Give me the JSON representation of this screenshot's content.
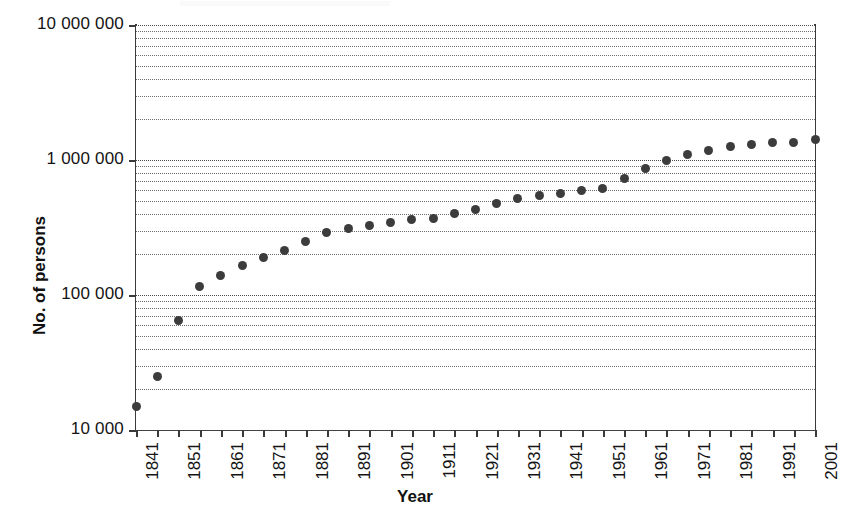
{
  "chart_data": {
    "type": "scatter",
    "title": "",
    "xlabel": "Year",
    "ylabel": "No. of persons",
    "yscale": "log",
    "ylim": [
      10000,
      10000000
    ],
    "xlim": [
      1841,
      2001
    ],
    "grid": true,
    "legend": false,
    "y_tick_labels": [
      "10 000 000",
      "1 000 000",
      "100 000",
      "10 000"
    ],
    "y_tick_values": [
      10000000,
      1000000,
      100000,
      10000
    ],
    "x_tick_labels": [
      "1841",
      "1851",
      "1861",
      "1871",
      "1881",
      "1891",
      "1901",
      "1911",
      "1921",
      "1931",
      "1941",
      "1951",
      "1961",
      "1971",
      "1981",
      "1991",
      "2001"
    ],
    "x_minor_tick_step": 5,
    "marker": "filled-circle",
    "marker_color": "#3c3c3c",
    "x": [
      1841,
      1846,
      1851,
      1856,
      1861,
      1866,
      1871,
      1876,
      1881,
      1886,
      1891,
      1896,
      1901,
      1906,
      1911,
      1916,
      1921,
      1926,
      1931,
      1936,
      1941,
      1946,
      1951,
      1956,
      1961,
      1966,
      1971,
      1976,
      1981,
      1986,
      1991,
      1996,
      2001
    ],
    "values": [
      15000,
      25000,
      65000,
      115000,
      140000,
      165000,
      190000,
      215000,
      250000,
      290000,
      310000,
      325000,
      345000,
      360000,
      370000,
      400000,
      430000,
      480000,
      520000,
      550000,
      560000,
      590000,
      610000,
      730000,
      870000,
      1000000,
      1090000,
      1180000,
      1250000,
      1300000,
      1340000,
      1350000,
      1420000
    ],
    "series": [
      {
        "name": "Population",
        "values": [
          15000,
          25000,
          65000,
          115000,
          140000,
          165000,
          190000,
          215000,
          250000,
          290000,
          310000,
          325000,
          345000,
          360000,
          370000,
          400000,
          430000,
          480000,
          520000,
          550000,
          560000,
          590000,
          610000,
          730000,
          870000,
          1000000,
          1090000,
          1180000,
          1250000,
          1300000,
          1340000,
          1350000,
          1420000
        ]
      }
    ]
  },
  "axes": {
    "y_title": "No. of persons",
    "x_title": "Year"
  }
}
